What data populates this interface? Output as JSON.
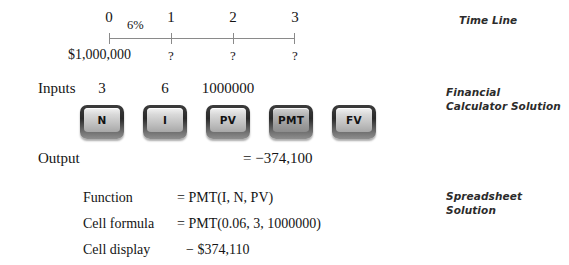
{
  "captions": {
    "timeline": "Time Line",
    "calculator": "Financial\nCalculator Solution",
    "spreadsheet": "Spreadsheet\nSolution"
  },
  "timeline": {
    "period_labels": [
      "0",
      "1",
      "2",
      "3"
    ],
    "rate_label": "6%",
    "present_value": "$1,000,000",
    "unknown_marks": [
      "?",
      "?",
      "?"
    ]
  },
  "calculator": {
    "inputs_label": "Inputs",
    "output_label": "Output",
    "input_values": [
      "3",
      "6",
      "1000000"
    ],
    "keys": [
      {
        "label": "N",
        "highlighted": false
      },
      {
        "label": "I",
        "highlighted": false
      },
      {
        "label": "PV",
        "highlighted": false
      },
      {
        "label": "PMT",
        "highlighted": true
      },
      {
        "label": "FV",
        "highlighted": false
      }
    ],
    "output_value": "= −374,100"
  },
  "spreadsheet": {
    "rows": [
      {
        "label": "Function",
        "value": "= PMT(I, N, PV)"
      },
      {
        "label": "Cell formula",
        "value": "= PMT(0.06, 3, 1000000)"
      },
      {
        "label": "Cell display",
        "value": "− $374,110"
      }
    ]
  }
}
